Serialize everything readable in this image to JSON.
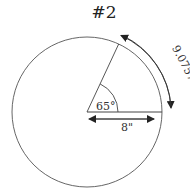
{
  "title": "#2",
  "diagram": {
    "type": "circle-sector",
    "angle_label": "65°",
    "radius_label": "8\"",
    "arc_length_label": "9.0757\"",
    "colors": {
      "stroke": "#333333",
      "background": "#ffffff"
    }
  }
}
